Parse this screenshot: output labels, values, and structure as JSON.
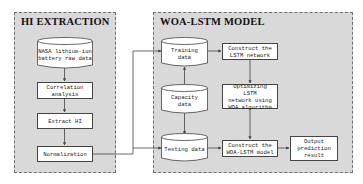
{
  "panels": {
    "left": {
      "title": "HI EXTRACTION"
    },
    "right": {
      "title": "WOA-LSTM MODEL"
    }
  },
  "nodes": {
    "nasa": {
      "type": "cylinder",
      "line1": "NASA lithium-ion",
      "line2": "battery raw data"
    },
    "correlation": {
      "type": "process",
      "line1": "Correlation",
      "line2": "analysis"
    },
    "extract": {
      "type": "process",
      "line1": "Extract HI"
    },
    "normalization": {
      "type": "process",
      "line1": "Normalization"
    },
    "training": {
      "type": "cylinder",
      "line1": "Training",
      "line2": "data"
    },
    "capacity": {
      "type": "cylinder",
      "line1": "Capacity",
      "line2": "data"
    },
    "testing": {
      "type": "cylinder",
      "line1": "Testing data"
    },
    "construct_lstm": {
      "type": "process",
      "line1": "Construct the",
      "line2": "LSTM network"
    },
    "optimizing": {
      "type": "process",
      "line1": "Optimizing LSTM",
      "line2": "network using",
      "line3": "WOA algorithm"
    },
    "construct_woa": {
      "type": "process",
      "line1": "Construct the",
      "line2": "WOA-LSTM model"
    },
    "output": {
      "type": "process",
      "line1": "Output",
      "line2": "prediction",
      "line3": "result"
    }
  },
  "edges": [
    [
      "nasa",
      "correlation"
    ],
    [
      "correlation",
      "extract"
    ],
    [
      "extract",
      "normalization"
    ],
    [
      "normalization",
      "training"
    ],
    [
      "normalization",
      "testing"
    ],
    [
      "capacity",
      "training"
    ],
    [
      "capacity",
      "testing"
    ],
    [
      "training",
      "construct_lstm"
    ],
    [
      "construct_lstm",
      "optimizing"
    ],
    [
      "optimizing",
      "construct_woa"
    ],
    [
      "testing",
      "construct_woa"
    ],
    [
      "construct_woa",
      "output"
    ]
  ],
  "colors": {
    "panel_fill": "#d9d9d9",
    "panel_border": "#707070",
    "node_fill": "#ffffff",
    "line": "#444444"
  }
}
